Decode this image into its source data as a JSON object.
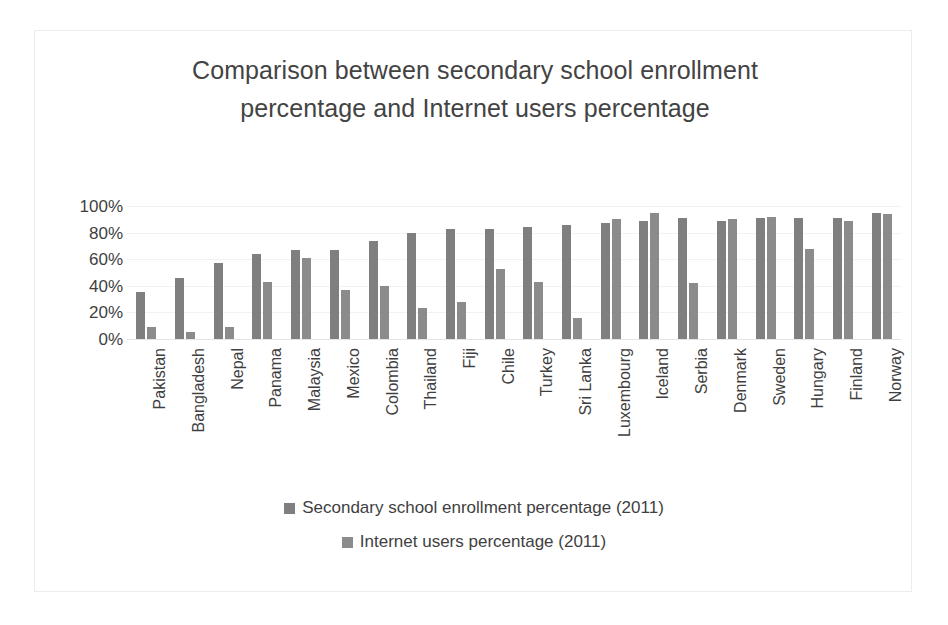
{
  "chart_data": {
    "type": "bar",
    "title": "Comparison between secondary school enrollment percentage and Internet users percentage",
    "xlabel": "",
    "ylabel": "",
    "ylim": [
      0,
      100
    ],
    "ytick_labels": [
      "100%",
      "80%",
      "60%",
      "40%",
      "20%",
      "0%"
    ],
    "ytick_values": [
      100,
      80,
      60,
      40,
      20,
      0
    ],
    "grid": true,
    "legend_position": "bottom",
    "categories": [
      "Pakistan",
      "Bangladesh",
      "Nepal",
      "Panama",
      "Malaysia",
      "Mexico",
      "Colombia",
      "Thailand",
      "Fiji",
      "Chile",
      "Turkey",
      "Sri Lanka",
      "Luxembourg",
      "Iceland",
      "Serbia",
      "Denmark",
      "Sweden",
      "Hungary",
      "Finland",
      "Norway"
    ],
    "series": [
      {
        "name": "Secondary school enrollment percentage (2011)",
        "color": "#7f7f7f",
        "values": [
          35,
          46,
          57,
          64,
          67,
          67,
          74,
          80,
          83,
          83,
          84,
          86,
          87,
          89,
          91,
          89,
          91,
          91,
          91,
          95
        ]
      },
      {
        "name": "Internet users percentage (2011)",
        "color": "#8b8b8b",
        "values": [
          9,
          5,
          9,
          43,
          61,
          37,
          40,
          23,
          28,
          53,
          43,
          16,
          90,
          95,
          42,
          90,
          92,
          68,
          89,
          94
        ]
      }
    ]
  },
  "legend": {
    "items": [
      {
        "label": "Secondary school enrollment percentage (2011)",
        "marker": "legend-swatch-icon"
      },
      {
        "label": "Internet users percentage (2011)",
        "marker": "legend-swatch-icon"
      }
    ]
  }
}
